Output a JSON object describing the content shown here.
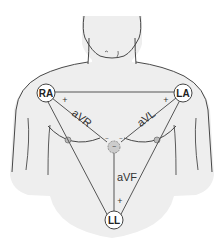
{
  "diagram": {
    "electrodes": [
      {
        "id": "RA",
        "label": "RA"
      },
      {
        "id": "LA",
        "label": "LA"
      },
      {
        "id": "LL",
        "label": "LL"
      }
    ],
    "leads": [
      {
        "id": "aVR",
        "label": "aVR"
      },
      {
        "id": "aVL",
        "label": "aVL"
      },
      {
        "id": "aVF",
        "label": "aVF"
      }
    ],
    "polarity": {
      "positive": "+",
      "negative": "−"
    },
    "colors": {
      "body_fill": "#eeeeee",
      "outline": "#333333",
      "lead_line": "#555555",
      "electrode_fill": "#ffffff",
      "central_terminal_fill": "#cccccc"
    }
  }
}
